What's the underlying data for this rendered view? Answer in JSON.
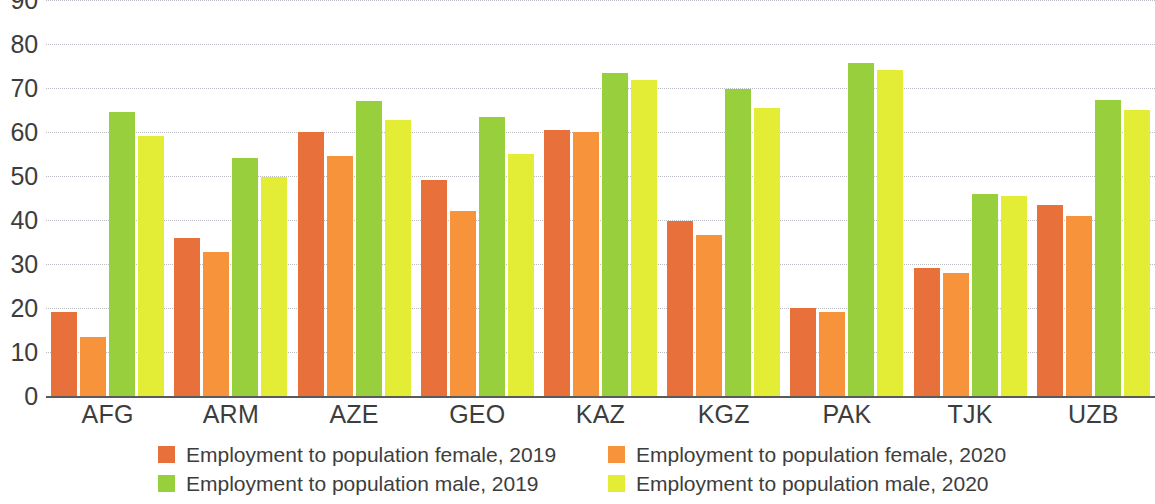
{
  "chart_data": {
    "type": "bar",
    "title": "",
    "subtitle": "",
    "xlabel": "",
    "ylabel": "",
    "ylim": [
      0,
      90
    ],
    "y_ticks": [
      0,
      10,
      20,
      30,
      40,
      50,
      60,
      70,
      80,
      90
    ],
    "grid": true,
    "grid_style": "dotted horizontal",
    "legend_position": "bottom",
    "categories": [
      "AFG",
      "ARM",
      "AZE",
      "GEO",
      "KAZ",
      "KGZ",
      "PAK",
      "TJK",
      "UZB"
    ],
    "series": [
      {
        "name": "Employment to population female, 2019",
        "color": "#e8703a",
        "values": [
          19,
          36,
          60,
          49,
          60.5,
          39.7,
          20,
          29,
          43.5
        ]
      },
      {
        "name": "Employment to population female, 2020",
        "color": "#f7933b",
        "values": [
          13.5,
          32.7,
          54.5,
          42,
          60,
          36.5,
          19,
          28,
          41
        ]
      },
      {
        "name": "Employment to population male, 2019",
        "color": "#97d03c",
        "values": [
          64.5,
          54,
          67,
          63.3,
          73.4,
          69.7,
          75.7,
          46,
          67.2
        ]
      },
      {
        "name": "Employment to population male, 2020",
        "color": "#e3ed36",
        "values": [
          59,
          49.8,
          62.8,
          55,
          71.8,
          65.4,
          74.2,
          45.5,
          65
        ]
      }
    ]
  },
  "axis": {
    "y_tick_labels": [
      "90",
      "80",
      "70",
      "60",
      "50",
      "40",
      "30",
      "20",
      "10",
      "0"
    ]
  },
  "legend": {
    "columns": [
      {
        "items": [
          {
            "label": "Employment to population female, 2019",
            "color": "#e8703a",
            "swatch_name": "legend-swatch-female-2019"
          },
          {
            "label": "Employment to population male, 2019",
            "color": "#97d03c",
            "swatch_name": "legend-swatch-male-2019"
          }
        ]
      },
      {
        "items": [
          {
            "label": "Employment to population female, 2020",
            "color": "#f7933b",
            "swatch_name": "legend-swatch-female-2020"
          },
          {
            "label": "Employment to population male, 2020",
            "color": "#e3ed36",
            "swatch_name": "legend-swatch-male-2020"
          }
        ]
      }
    ]
  }
}
